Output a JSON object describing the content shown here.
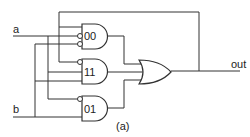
{
  "diagram": {
    "type": "logic-circuit",
    "inputs": [
      {
        "label": "a"
      },
      {
        "label": "b"
      }
    ],
    "output": {
      "label": "out"
    },
    "gates": [
      {
        "id": "g00",
        "type": "AND",
        "label": "00",
        "inverted_inputs": [
          "a",
          "b"
        ],
        "other_inputs": [
          "out (feedback)"
        ]
      },
      {
        "id": "g11",
        "type": "AND",
        "label": "11",
        "inverted_inputs": [
          "out (feedback)"
        ],
        "other_inputs": [
          "a",
          "b"
        ]
      },
      {
        "id": "g01",
        "type": "AND",
        "label": "01",
        "inverted_inputs": [
          "a"
        ],
        "other_inputs": [
          "b"
        ]
      },
      {
        "id": "gor",
        "type": "OR",
        "label": "",
        "inputs": [
          "00",
          "11",
          "01"
        ]
      }
    ],
    "caption": "(a)"
  }
}
